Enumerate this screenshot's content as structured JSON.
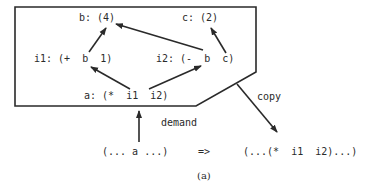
{
  "diagram": {
    "nodes": {
      "b": "b: (4)",
      "c": "c: (2)",
      "i1": "i1: (+  b  1)",
      "i2": "i2: (-  b  c)",
      "a": "a: (*  i1  i2)"
    },
    "edges": [
      {
        "from": "i1.b",
        "to": "b"
      },
      {
        "from": "i2.b",
        "to": "b"
      },
      {
        "from": "i2.c",
        "to": "c"
      },
      {
        "from": "a.i1",
        "to": "i1.b"
      },
      {
        "from": "a.i2",
        "to": "i2.b"
      }
    ],
    "labels": {
      "demand": "demand",
      "copy": "copy",
      "expr_before": "(... a ...)",
      "arrow": "=>",
      "expr_after": "(...(*  i1  i2)...)",
      "caption": "(a)"
    },
    "colors": {
      "ink": "#2a2a2a",
      "background": "#ffffff"
    }
  }
}
